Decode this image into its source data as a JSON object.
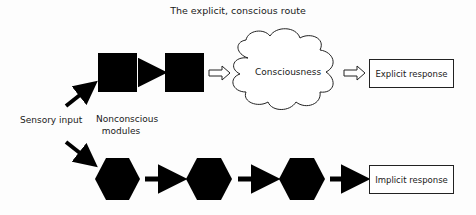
{
  "diagram": {
    "title": "The explicit, conscious route",
    "input_label": "Sensory input",
    "modules_label_line1": "Nonconscious",
    "modules_label_line2": "modules",
    "consciousness_label": "Consciousness",
    "explicit_response_label": "Explicit response",
    "implicit_response_label": "Implicit response",
    "colors": {
      "node_fill": "#000000",
      "stroke": "#222222",
      "background": "#fdfdfd"
    },
    "explicit_route": {
      "nodes": [
        "square",
        "square",
        "cloud:Consciousness",
        "box:Explicit response"
      ],
      "connectors": [
        "solid-arrow",
        "hollow-arrow",
        "hollow-arrow"
      ]
    },
    "implicit_route": {
      "nodes": [
        "hexagon",
        "hexagon",
        "hexagon",
        "box:Implicit response"
      ],
      "connectors": [
        "solid-arrow",
        "solid-arrow",
        "solid-arrow"
      ]
    }
  }
}
